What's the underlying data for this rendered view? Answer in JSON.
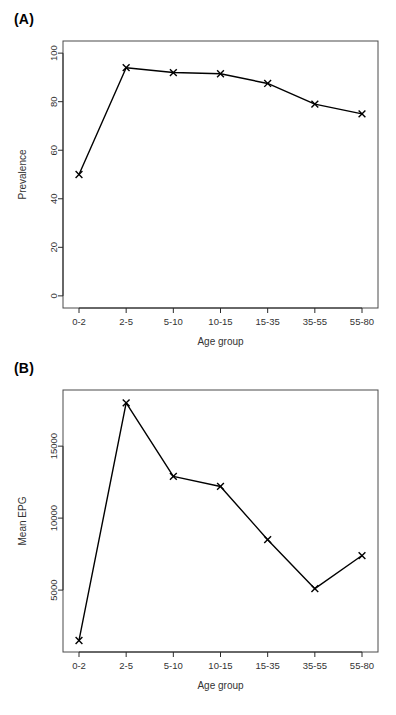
{
  "figure": {
    "panels": [
      {
        "label": "(A)",
        "id": "panel-a"
      },
      {
        "label": "(B)",
        "id": "panel-b"
      }
    ]
  },
  "chart_data": [
    {
      "type": "line",
      "panel": "(A)",
      "title": "",
      "xlabel": "Age group",
      "ylabel": "Prevalence",
      "categories": [
        "0-2",
        "2-5",
        "5-10",
        "10-15",
        "15-35",
        "35-55",
        "55-80"
      ],
      "values": [
        50,
        94,
        92,
        91.5,
        87.5,
        79,
        75
      ],
      "yticks": [
        0,
        20,
        40,
        60,
        80,
        100
      ],
      "yticklabels": [
        "0",
        "20",
        "40",
        "60",
        "80",
        "100"
      ],
      "ylim": [
        -5,
        105
      ],
      "grid": false,
      "legend": false,
      "marker": "x",
      "line_color": "#000000"
    },
    {
      "type": "line",
      "panel": "(B)",
      "title": "",
      "xlabel": "Age group",
      "ylabel": "Mean EPG",
      "categories": [
        "0-2",
        "2-5",
        "5-10",
        "10-15",
        "15-35",
        "35-55",
        "55-80"
      ],
      "values": [
        1500,
        18000,
        12900,
        12200,
        8500,
        5100,
        7400
      ],
      "yticks": [
        5000,
        10000,
        15000
      ],
      "yticklabels": [
        "5000",
        "10000",
        "15000"
      ],
      "ylim": [
        700,
        18900
      ],
      "grid": false,
      "legend": false,
      "marker": "x",
      "line_color": "#000000"
    }
  ]
}
